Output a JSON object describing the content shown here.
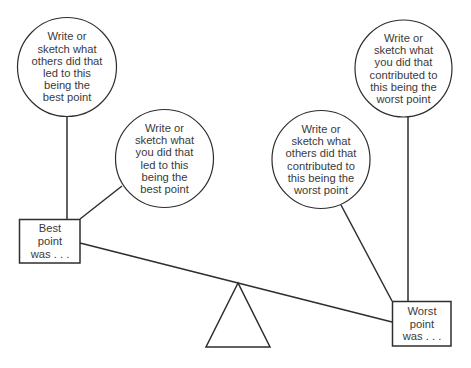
{
  "diagram": {
    "type": "balance-scale",
    "colors": {
      "stroke": "#2e2e2e",
      "text": "#3a3a3a",
      "background": "#ffffff"
    },
    "left_side": {
      "box": {
        "label": "Best\npoint\nwas . . ."
      },
      "circles": [
        {
          "id": "others-best",
          "text": "Write or\nsketch what\nothers did that\nled to this\nbeing the\nbest point"
        },
        {
          "id": "you-best",
          "text": "Write or\nsketch what\nyou did that\nled to this\nbeing the\nbest point"
        }
      ]
    },
    "right_side": {
      "box": {
        "label": "Worst\npoint\nwas . . ."
      },
      "circles": [
        {
          "id": "others-worst",
          "text": "Write or\nsketch what\nothers did that\ncontributed to\nthis being the\nworst point"
        },
        {
          "id": "you-worst",
          "text": "Write or\nsketch what\nyou did that\ncontributed to\nthis being the\nworst point"
        }
      ]
    },
    "fulcrum": {
      "shape": "triangle"
    }
  }
}
